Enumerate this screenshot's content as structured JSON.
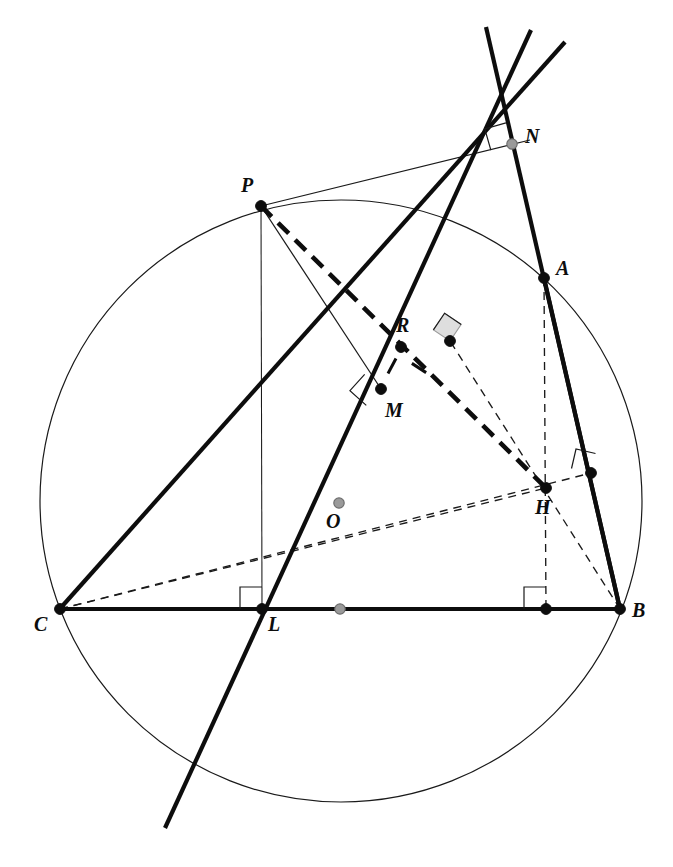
{
  "figure": {
    "canvas": {
      "width": 673,
      "height": 867
    },
    "colors": {
      "stroke": "#0d0d0d",
      "thin": "#1a1a1a",
      "gray_point_fill": "#9a9a9a",
      "gray_point_stroke": "#6e6e6e",
      "right_angle_fill_shaded": "#dedede",
      "background": "#ffffff"
    },
    "stroke_widths": {
      "thick": 4.2,
      "medium": 3.2,
      "thin": 1.1,
      "hairline": 1.0,
      "dashed_thick": 4.6,
      "dashed_thin": 1.3
    }
  },
  "points": {
    "A": {
      "label": "A",
      "x": 544,
      "y": 278,
      "dot": "solid-black",
      "label_x": 556,
      "label_y": 258
    },
    "B": {
      "label": "B",
      "x": 620,
      "y": 609,
      "dot": "solid-black",
      "label_x": 632,
      "label_y": 600
    },
    "C": {
      "label": "C",
      "x": 60,
      "y": 609,
      "dot": "solid-black",
      "label_x": 34,
      "label_y": 614
    },
    "P": {
      "label": "P",
      "x": 261,
      "y": 206,
      "dot": "solid-black",
      "label_x": 241,
      "label_y": 175
    },
    "N": {
      "label": "N",
      "x": 512,
      "y": 144,
      "dot": "gray",
      "label_x": 525,
      "label_y": 126
    },
    "R": {
      "label": "R",
      "x": 401,
      "y": 347,
      "dot": "solid-black",
      "label_x": 396,
      "label_y": 315
    },
    "M": {
      "label": "M",
      "x": 381,
      "y": 389,
      "dot": "solid-black",
      "label_x": 385,
      "label_y": 400
    },
    "H": {
      "label": "H",
      "x": 546,
      "y": 488,
      "dot": "solid-black",
      "label_x": 535,
      "label_y": 497
    },
    "L": {
      "label": "L",
      "x": 262,
      "y": 609,
      "dot": "solid-black",
      "label_x": 268,
      "label_y": 614
    },
    "O": {
      "label": "O",
      "x": 339,
      "y": 503,
      "dot": "gray",
      "label_x": 326,
      "label_y": 511
    }
  },
  "unlabeled_points": [
    {
      "name": "midpoint-of-CB",
      "x": 340,
      "y": 609,
      "dot": "gray"
    },
    {
      "name": "foot-of-altitude-from-A-on-CB",
      "x": 546,
      "y": 609,
      "dot": "solid-black"
    },
    {
      "name": "foot-of-altitude-from-C-on-AB",
      "x": 591,
      "y": 473,
      "dot": "solid-black"
    },
    {
      "name": "foot-of-perpendicular-from-H-on-AC",
      "x": 450,
      "y": 341,
      "dot": "solid-black"
    }
  ],
  "circle": {
    "name": "circumcircle",
    "cx": 341,
    "cy": 501,
    "r": 301
  },
  "segments": {
    "side_CB": {
      "from": "C",
      "to": "B",
      "weight": "thick",
      "style": "solid"
    },
    "side_CA_extended": {
      "from": [
        57,
        612
      ],
      "to": [
        565,
        42
      ],
      "weight": "thick",
      "style": "solid",
      "note": "line C-M-A-extended through N region"
    },
    "side_AB": {
      "from": "A",
      "to": "B",
      "weight": "thick",
      "style": "solid"
    },
    "line_NA_B": {
      "from": [
        486,
        27
      ],
      "to": [
        620,
        609
      ],
      "weight": "thick",
      "style": "solid",
      "note": "line through N, A, B"
    },
    "line_through_L_M_R_N": {
      "from": [
        165,
        828
      ],
      "to": [
        531,
        30
      ],
      "weight": "thick",
      "style": "solid",
      "note": "reflection / Simson-type line L-M-R-N"
    },
    "chord_P_to_L_vertical": {
      "from": "P",
      "to": "L",
      "weight": "hairline",
      "style": "solid"
    },
    "perp_P_to_M": {
      "from": "P",
      "to": "M",
      "weight": "thin",
      "style": "solid"
    },
    "tangent_P_to_N": {
      "from": "P",
      "to": [
        530,
        140
      ],
      "weight": "thin",
      "style": "solid"
    },
    "dashed_P_to_H": {
      "from": "P",
      "to": "H",
      "weight": "dashed_thick",
      "style": "dashed",
      "note": "thick dashed through R"
    },
    "dashed_C_to_H": {
      "from": "C",
      "to": "H",
      "weight": "dashed_thin",
      "style": "dashed",
      "note": "passes near O toward foot on AB"
    },
    "dashed_C_to_footAB": {
      "from": "C",
      "to": [
        591,
        473
      ],
      "weight": "dashed_thin",
      "style": "dashed"
    },
    "dashed_A_to_footCB": {
      "from": "A",
      "to": [
        546,
        609
      ],
      "weight": "dashed_thin",
      "style": "dashed",
      "note": "altitude from A, vertical"
    },
    "dashed_B_to_footAC": {
      "from": "B",
      "to": [
        450,
        341
      ],
      "weight": "dashed_thin",
      "style": "dashed",
      "note": "altitude from B through H"
    },
    "dashed_H_to_footAC": {
      "from": "H",
      "to": [
        450,
        341
      ],
      "weight": "dashed_thin",
      "style": "dashed"
    }
  },
  "right_angle_marks": [
    {
      "name": "right-angle-at-N",
      "x": 512,
      "y": 144,
      "size": 22,
      "rotation": -16,
      "shaded": false
    },
    {
      "name": "right-angle-at-M",
      "x": 381,
      "y": 389,
      "size": 22,
      "rotation": -48,
      "shaded": false
    },
    {
      "name": "right-angle-at-footAC",
      "x": 450,
      "y": 341,
      "size": 20,
      "rotation": 34,
      "shaded": true
    },
    {
      "name": "right-angle-at-footAB",
      "x": 591,
      "y": 473,
      "size": 20,
      "rotation": 13,
      "shaded": false
    },
    {
      "name": "right-angle-at-L",
      "x": 262,
      "y": 609,
      "size": 22,
      "rotation": 0,
      "shaded": false
    },
    {
      "name": "right-angle-at-footCB",
      "x": 546,
      "y": 609,
      "size": 22,
      "rotation": 0,
      "shaded": false
    }
  ],
  "tick_marks": [
    {
      "name": "tick-on-RM-upper",
      "x": 392,
      "y": 366,
      "angle": -62,
      "length": 17
    },
    {
      "name": "tick-on-MfootAC",
      "x": 419,
      "y": 368,
      "angle": 33,
      "length": 17
    }
  ],
  "labels_order": [
    "P",
    "N",
    "A",
    "R",
    "M",
    "O",
    "H",
    "C",
    "L",
    "B"
  ]
}
